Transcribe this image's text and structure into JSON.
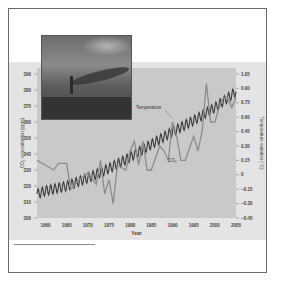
{
  "chart_data": {
    "type": "line",
    "title": "",
    "xlabel": "Year",
    "ylabel_left": "CO2 concentration (ppm)",
    "ylabel_right": "Temperature variation (°C)",
    "x_ticks": [
      1960,
      1965,
      1970,
      1975,
      1980,
      1985,
      1990,
      1995,
      2000,
      2005
    ],
    "y_left_ticks": [
      300,
      310,
      320,
      330,
      340,
      350,
      360,
      370,
      380,
      390
    ],
    "y_right_ticks": [
      -0.45,
      -0.3,
      -0.15,
      0,
      0.15,
      0.3,
      0.45,
      0.6,
      0.75,
      0.9,
      1.05
    ],
    "y_left_range": [
      300,
      390
    ],
    "y_right_range": [
      -0.45,
      1.05
    ],
    "x_range": [
      1958,
      2005
    ],
    "grid": false,
    "annotations": [
      "Temperature",
      "CO2"
    ],
    "series": [
      {
        "name": "Temperature",
        "axis": "right",
        "x": [
          1958,
          1960,
          1962,
          1963,
          1965,
          1966,
          1968,
          1970,
          1972,
          1973,
          1974,
          1975,
          1976,
          1977,
          1979,
          1980,
          1981,
          1982,
          1983,
          1984,
          1985,
          1987,
          1988,
          1989,
          1990,
          1991,
          1992,
          1993,
          1995,
          1996,
          1997,
          1998,
          1999,
          2000,
          2001,
          2002,
          2003,
          2004,
          2005
        ],
        "values": [
          0.15,
          0.1,
          0.05,
          0.12,
          0.12,
          -0.15,
          -0.05,
          0.02,
          -0.1,
          0.15,
          -0.2,
          -0.05,
          -0.3,
          0.1,
          0.05,
          0.25,
          0.35,
          0.1,
          0.35,
          0.05,
          0.05,
          0.3,
          0.25,
          0.15,
          0.55,
          0.4,
          0.15,
          0.15,
          0.4,
          0.25,
          0.45,
          0.95,
          0.55,
          0.55,
          0.7,
          0.8,
          0.8,
          0.7,
          0.8
        ]
      },
      {
        "name": "CO2",
        "axis": "left",
        "x": [
          1958,
          1960,
          1965,
          1970,
          1975,
          1980,
          1985,
          1990,
          1995,
          2000,
          2005
        ],
        "values": [
          315,
          317,
          320,
          325,
          331,
          338,
          346,
          354,
          361,
          369,
          379
        ],
        "seasonal_amplitude_ppm": 3
      }
    ]
  },
  "labels": {
    "temperature": "Temperature",
    "co2": "CO₂",
    "xlabel": "Year",
    "ylabel_left": "CO₂ concentration (ppm)",
    "ylabel_right": "Temperature variation (°C)"
  },
  "colors": {
    "band": "#e4e4e4",
    "plot_bg": "#c9c9c9",
    "temperature_line": "#8c8c8c",
    "co2_line": "#3a3a3a",
    "frame": "#6a6a6a"
  }
}
